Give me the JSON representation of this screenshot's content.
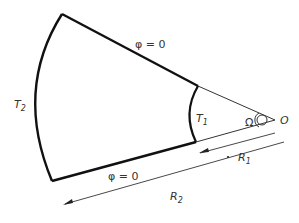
{
  "diagram": {
    "labels": {
      "phi_top": "φ = 0",
      "phi_bottom": "φ = 0",
      "T2": "T",
      "T2_sub": "2",
      "T1": "T",
      "T1_sub": "1",
      "omega": "Ω",
      "origin": "O",
      "R1": "R",
      "R1_sub": "1",
      "R2": "R",
      "R2_sub": "2"
    },
    "colors": {
      "stroke": "#111111",
      "thin": "#333333",
      "text": "#333333"
    }
  }
}
